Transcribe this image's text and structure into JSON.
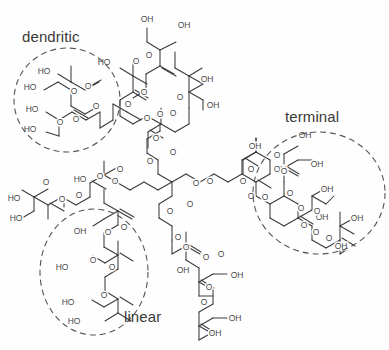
{
  "figure": {
    "background_color": "#fefefe",
    "bond_color": "#3a3a3a",
    "atom_label_color": "#4a4a4a",
    "annotation_color": "#3a3a3a",
    "dash_color": "#555555"
  },
  "annotations": [
    {
      "id": "dendritic",
      "label": "dendritic",
      "shape": "circle",
      "cx": 67,
      "cy": 100,
      "rx": 53,
      "ry": 52,
      "label_x": 22,
      "label_y": 28
    },
    {
      "id": "terminal",
      "label": "terminal",
      "shape": "circle",
      "cx": 319,
      "cy": 193,
      "rx": 66,
      "ry": 61,
      "label_x": 285,
      "label_y": 108
    },
    {
      "id": "linear",
      "label": "linear",
      "shape": "ellipse",
      "cx": 94,
      "cy": 272,
      "rx": 54,
      "ry": 63,
      "label_x": 124,
      "label_y": 308
    }
  ],
  "atom_labels": [
    {
      "t": "OH",
      "x": 147,
      "y": 20
    },
    {
      "t": "OH",
      "x": 184,
      "y": 26
    },
    {
      "t": "O",
      "x": 136,
      "y": 62
    },
    {
      "t": "O",
      "x": 149,
      "y": 56
    },
    {
      "t": "HO",
      "x": 104,
      "y": 63
    },
    {
      "t": "O",
      "x": 144,
      "y": 93
    },
    {
      "t": "O",
      "x": 128,
      "y": 105
    },
    {
      "t": "HO",
      "x": 44,
      "y": 72
    },
    {
      "t": "HO",
      "x": 30,
      "y": 88
    },
    {
      "t": "O",
      "x": 74,
      "y": 92
    },
    {
      "t": "O",
      "x": 88,
      "y": 87
    },
    {
      "t": "HO",
      "x": 32,
      "y": 110
    },
    {
      "t": "HO",
      "x": 30,
      "y": 130
    },
    {
      "t": "O",
      "x": 60,
      "y": 123
    },
    {
      "t": "O",
      "x": 76,
      "y": 120
    },
    {
      "t": "O",
      "x": 96,
      "y": 107
    },
    {
      "t": "O",
      "x": 147,
      "y": 119
    },
    {
      "t": "O",
      "x": 160,
      "y": 115
    },
    {
      "t": "OH",
      "x": 207,
      "y": 80
    },
    {
      "t": "OH",
      "x": 213,
      "y": 106
    },
    {
      "t": "O",
      "x": 180,
      "y": 98
    },
    {
      "t": "O",
      "x": 173,
      "y": 114
    },
    {
      "t": "O",
      "x": 156,
      "y": 139
    },
    {
      "t": "O",
      "x": 150,
      "y": 162
    },
    {
      "t": "O",
      "x": 173,
      "y": 153
    },
    {
      "t": "O",
      "x": 115,
      "y": 182
    },
    {
      "t": "O",
      "x": 46,
      "y": 183
    },
    {
      "t": "HO",
      "x": 14,
      "y": 199
    },
    {
      "t": "HO",
      "x": 16,
      "y": 219
    },
    {
      "t": "O",
      "x": 62,
      "y": 200
    },
    {
      "t": "O",
      "x": 79,
      "y": 196
    },
    {
      "t": "HO",
      "x": 80,
      "y": 180
    },
    {
      "t": "O",
      "x": 100,
      "y": 177
    },
    {
      "t": "O",
      "x": 120,
      "y": 170
    },
    {
      "t": "O",
      "x": 210,
      "y": 182
    },
    {
      "t": "O",
      "x": 196,
      "y": 184
    },
    {
      "t": "O",
      "x": 190,
      "y": 205
    },
    {
      "t": "O",
      "x": 170,
      "y": 212
    },
    {
      "t": "O",
      "x": 178,
      "y": 238
    },
    {
      "t": "O",
      "x": 186,
      "y": 248
    },
    {
      "t": "OH",
      "x": 183,
      "y": 271
    },
    {
      "t": "O",
      "x": 206,
      "y": 258
    },
    {
      "t": "O",
      "x": 221,
      "y": 255
    },
    {
      "t": "OH",
      "x": 237,
      "y": 276
    },
    {
      "t": "O",
      "x": 209,
      "y": 288
    },
    {
      "t": "O",
      "x": 204,
      "y": 303
    },
    {
      "t": "OH",
      "x": 235,
      "y": 319
    },
    {
      "t": "OH",
      "x": 215,
      "y": 334
    },
    {
      "t": "OH",
      "x": 80,
      "y": 232
    },
    {
      "t": "O",
      "x": 108,
      "y": 233
    },
    {
      "t": "O",
      "x": 124,
      "y": 228
    },
    {
      "t": "HO",
      "x": 62,
      "y": 268
    },
    {
      "t": "O",
      "x": 93,
      "y": 261
    },
    {
      "t": "O",
      "x": 112,
      "y": 268
    },
    {
      "t": "HO",
      "x": 68,
      "y": 303
    },
    {
      "t": "HO",
      "x": 74,
      "y": 322
    },
    {
      "t": "O",
      "x": 104,
      "y": 296
    },
    {
      "t": "OH",
      "x": 255,
      "y": 147
    },
    {
      "t": "OH",
      "x": 280,
      "y": 170
    },
    {
      "t": "O",
      "x": 243,
      "y": 182
    },
    {
      "t": "O",
      "x": 251,
      "y": 170
    },
    {
      "t": "O",
      "x": 265,
      "y": 198
    },
    {
      "t": "O",
      "x": 251,
      "y": 197
    },
    {
      "t": "OH",
      "x": 305,
      "y": 136
    },
    {
      "t": "OH",
      "x": 317,
      "y": 165
    },
    {
      "t": "O",
      "x": 277,
      "y": 156
    },
    {
      "t": "O",
      "x": 284,
      "y": 172
    },
    {
      "t": "O",
      "x": 290,
      "y": 194
    },
    {
      "t": "O",
      "x": 301,
      "y": 209
    },
    {
      "t": "OH",
      "x": 327,
      "y": 190
    },
    {
      "t": "OH",
      "x": 322,
      "y": 218
    },
    {
      "t": "O",
      "x": 304,
      "y": 226
    },
    {
      "t": "O",
      "x": 316,
      "y": 233
    },
    {
      "t": "OH",
      "x": 357,
      "y": 219
    },
    {
      "t": "OH",
      "x": 341,
      "y": 247
    },
    {
      "t": "O",
      "x": 329,
      "y": 239
    },
    {
      "t": "O",
      "x": 317,
      "y": 212
    }
  ],
  "chemistry": {
    "core": "pentaerythritol ethoxylate",
    "repeat_unit": "bis-MPA (2,2-bis(hydroxymethyl)propionic acid)",
    "unit_types": [
      "dendritic",
      "linear",
      "terminal"
    ]
  }
}
